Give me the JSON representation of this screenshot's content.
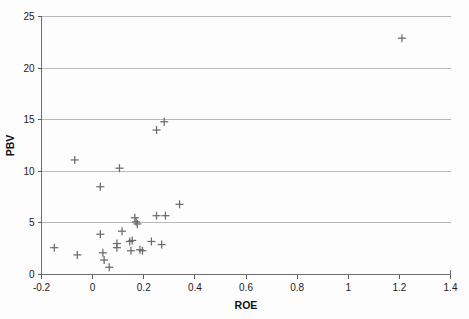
{
  "chart_data": {
    "type": "scatter",
    "title": "",
    "xlabel": "ROE",
    "ylabel": "PBV",
    "xlim": [
      -0.2,
      1.4
    ],
    "ylim": [
      0,
      25
    ],
    "xticks": [
      "-0.2",
      "0",
      "0.2",
      "0.4",
      "0.6",
      "0.8",
      "1",
      "1.2",
      "1.4"
    ],
    "xtick_values": [
      -0.2,
      0,
      0.2,
      0.4,
      0.6,
      0.8,
      1.0,
      1.2,
      1.4
    ],
    "yticks": [
      "0",
      "5",
      "10",
      "15",
      "20",
      "25"
    ],
    "ytick_values": [
      0,
      5,
      10,
      15,
      20,
      25
    ],
    "grid": "horizontal",
    "legend": "none",
    "marker_style": "plus",
    "marker_color": "#6b6b6b",
    "series": [
      {
        "name": "Companies",
        "points": [
          {
            "x": -0.15,
            "y": 2.6
          },
          {
            "x": -0.07,
            "y": 11.1
          },
          {
            "x": -0.06,
            "y": 1.9
          },
          {
            "x": 0.03,
            "y": 8.5
          },
          {
            "x": 0.03,
            "y": 3.9
          },
          {
            "x": 0.04,
            "y": 2.1
          },
          {
            "x": 0.045,
            "y": 1.4
          },
          {
            "x": 0.065,
            "y": 0.7
          },
          {
            "x": 0.095,
            "y": 3.0
          },
          {
            "x": 0.095,
            "y": 2.6
          },
          {
            "x": 0.105,
            "y": 10.3
          },
          {
            "x": 0.115,
            "y": 4.2
          },
          {
            "x": 0.145,
            "y": 3.2
          },
          {
            "x": 0.15,
            "y": 2.3
          },
          {
            "x": 0.155,
            "y": 3.3
          },
          {
            "x": 0.165,
            "y": 5.5
          },
          {
            "x": 0.17,
            "y": 5.1
          },
          {
            "x": 0.175,
            "y": 4.9
          },
          {
            "x": 0.185,
            "y": 2.4
          },
          {
            "x": 0.195,
            "y": 2.3
          },
          {
            "x": 0.23,
            "y": 3.2
          },
          {
            "x": 0.25,
            "y": 14.0
          },
          {
            "x": 0.25,
            "y": 5.7
          },
          {
            "x": 0.27,
            "y": 2.9
          },
          {
            "x": 0.28,
            "y": 14.8
          },
          {
            "x": 0.285,
            "y": 5.7
          },
          {
            "x": 0.34,
            "y": 6.8
          },
          {
            "x": 1.21,
            "y": 22.9
          }
        ]
      }
    ]
  }
}
